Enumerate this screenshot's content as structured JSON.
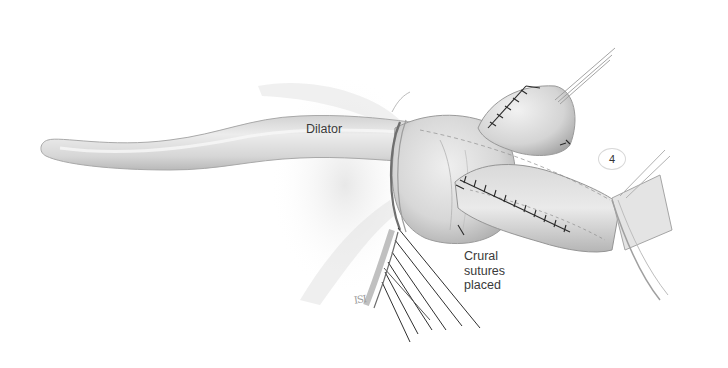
{
  "figure": {
    "type": "surgical-illustration",
    "style": "grayscale pencil shading",
    "step_number": "4",
    "labels": {
      "dilator": "Dilator",
      "crural_sutures": [
        "Crural",
        "sutures",
        "placed"
      ]
    },
    "signature": "ISI",
    "colors": {
      "background": "#ffffff",
      "tissue_light": "#e4e4e4",
      "tissue_mid": "#c9c9c9",
      "tissue_dark": "#9a9a9a",
      "suture": "#2a2a2a",
      "label_text": "#3a3a3a"
    }
  }
}
